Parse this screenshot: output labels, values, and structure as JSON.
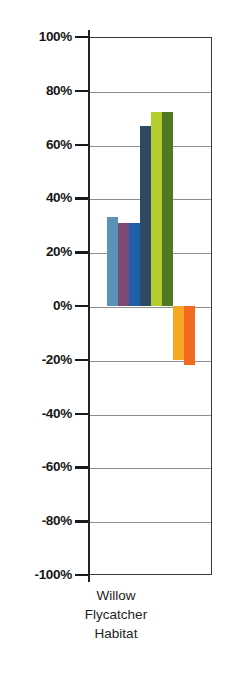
{
  "chart_data": {
    "type": "bar",
    "title": "",
    "xlabel": "",
    "ylabel": "",
    "categories": [
      "Willow Flycatcher Habitat"
    ],
    "category_label_lines": [
      "Willow",
      "Flycatcher",
      "Habitat"
    ],
    "ylim": [
      -100,
      100
    ],
    "ytick_labels": [
      "100%",
      "80%",
      "60%",
      "40%",
      "20%",
      "0%",
      "-20%",
      "-40%",
      "-60%",
      "-80%",
      "-100%"
    ],
    "ytick_values": [
      100,
      80,
      60,
      40,
      20,
      0,
      -20,
      -40,
      -60,
      -80,
      -100
    ],
    "grid": true,
    "legend": "none",
    "series": [
      {
        "name": "series-1",
        "color": "#5b92b8",
        "values": [
          33
        ]
      },
      {
        "name": "series-2",
        "color": "#7c4a72",
        "values": [
          31
        ]
      },
      {
        "name": "series-3",
        "color": "#1f5fa8",
        "values": [
          31
        ]
      },
      {
        "name": "series-4",
        "color": "#2d4a63",
        "values": [
          67
        ]
      },
      {
        "name": "series-5",
        "color": "#b5cc2e",
        "values": [
          72
        ]
      },
      {
        "name": "series-6",
        "color": "#4f7a23",
        "values": [
          72
        ]
      },
      {
        "name": "series-7",
        "color": "#f5a623",
        "values": [
          -20
        ]
      },
      {
        "name": "series-8",
        "color": "#f4691e",
        "values": [
          -22
        ]
      }
    ]
  }
}
